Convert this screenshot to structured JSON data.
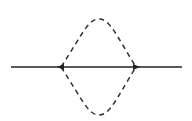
{
  "diagram": {
    "type": "feynman-loop",
    "colors": {
      "line": "#222222",
      "background": "#ffffff"
    },
    "fermion_line": {
      "x1": 11,
      "x2": 182,
      "y": 67
    },
    "vertices": [
      {
        "id": "left",
        "x": 61,
        "y": 67,
        "arrow": "left"
      },
      {
        "id": "right",
        "x": 136,
        "y": 67,
        "arrow": "right"
      }
    ],
    "scalar_loop": {
      "style": "dashed",
      "top_y": 19,
      "bottom_y": 115,
      "center_x": 99
    }
  }
}
